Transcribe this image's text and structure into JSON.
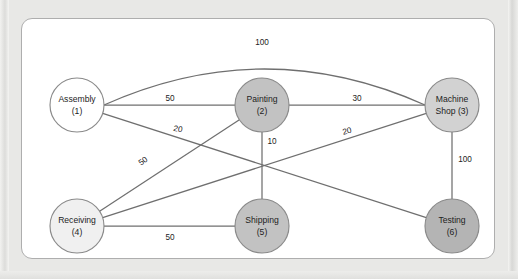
{
  "figure": {
    "panel_background": "#ffffff",
    "page_background": "#e8e8e6",
    "border_color": "#aeaeae"
  },
  "chart_data": {
    "type": "diagram",
    "diagram_kind": "undirected-weighted-network",
    "title": "",
    "nodes": [
      {
        "id": 1,
        "name": "Assembly",
        "index_label": "(1)",
        "line1": "Assembly",
        "line2": "(1)",
        "cx": 77,
        "cy": 105,
        "r": 27,
        "fill": "#ffffff"
      },
      {
        "id": 2,
        "name": "Painting",
        "index_label": "(2)",
        "line1": "Painting",
        "line2": "(2)",
        "cx": 262,
        "cy": 105,
        "r": 27,
        "fill": "#c2c2c2"
      },
      {
        "id": 3,
        "name": "Machine Shop",
        "index_label": "(3)",
        "line1": "Machine",
        "line2": "Shop (3)",
        "cx": 452,
        "cy": 105,
        "r": 27,
        "fill": "#d2d2d2"
      },
      {
        "id": 4,
        "name": "Receiving",
        "index_label": "(4)",
        "line1": "Receiving",
        "line2": "(4)",
        "cx": 77,
        "cy": 226,
        "r": 27,
        "fill": "#f0f0f0"
      },
      {
        "id": 5,
        "name": "Shipping",
        "index_label": "(5)",
        "line1": "Shipping",
        "line2": "(5)",
        "cx": 262,
        "cy": 226,
        "r": 27,
        "fill": "#c2c2c2"
      },
      {
        "id": 6,
        "name": "Testing",
        "index_label": "(6)",
        "line1": "Testing",
        "line2": "(6)",
        "cx": 452,
        "cy": 226,
        "r": 27,
        "fill": "#b4b4b4"
      }
    ],
    "edges": [
      {
        "from": 1,
        "to": 3,
        "weight": 100,
        "label": "100",
        "style": "curved",
        "label_x": 262,
        "label_y": 42,
        "rotation": 0
      },
      {
        "from": 1,
        "to": 2,
        "weight": 50,
        "label": "50",
        "style": "straight",
        "label_x": 170,
        "label_y": 98,
        "rotation": 0
      },
      {
        "from": 2,
        "to": 3,
        "weight": 30,
        "label": "30",
        "style": "straight",
        "label_x": 357,
        "label_y": 98,
        "rotation": 0
      },
      {
        "from": 1,
        "to": 6,
        "weight": 20,
        "label": "20",
        "style": "straight",
        "label_x": 178,
        "label_y": 129,
        "rotation": 11
      },
      {
        "from": 4,
        "to": 2,
        "weight": 50,
        "label": "50",
        "style": "straight",
        "label_x": 143,
        "label_y": 161,
        "rotation": -36
      },
      {
        "from": 4,
        "to": 3,
        "weight": 20,
        "label": "20",
        "style": "straight",
        "label_x": 347,
        "label_y": 131,
        "rotation": -13
      },
      {
        "from": 2,
        "to": 5,
        "weight": 10,
        "label": "10",
        "style": "straight",
        "label_x": 272,
        "label_y": 141,
        "rotation": 0
      },
      {
        "from": 3,
        "to": 6,
        "weight": 100,
        "label": "100",
        "style": "straight",
        "label_x": 465,
        "label_y": 159,
        "rotation": 0
      },
      {
        "from": 4,
        "to": 5,
        "weight": 50,
        "label": "50",
        "style": "straight",
        "label_x": 170,
        "label_y": 237,
        "rotation": 0
      }
    ],
    "weights_summary": [
      100,
      50,
      30,
      20,
      50,
      20,
      10,
      100,
      50
    ],
    "node_count": 6,
    "edge_count": 9
  }
}
